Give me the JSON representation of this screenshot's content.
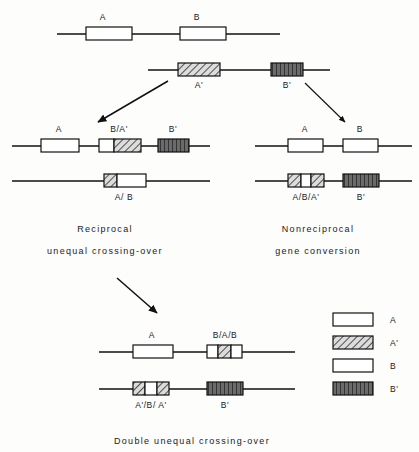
{
  "figure": {
    "header_note": "",
    "legend": {
      "name": "gene-legend",
      "entries": [
        {
          "label": "A",
          "fill": "white",
          "pattern": "empty"
        },
        {
          "label": "A'",
          "fill": "hatch",
          "pattern": "diagonal-hatch"
        },
        {
          "label": "B",
          "fill": "white",
          "pattern": "empty"
        },
        {
          "label": "B'",
          "fill": "dark",
          "pattern": "vertical-stripe-dark"
        }
      ]
    },
    "captions": {
      "left_line1": "Reciprocal",
      "left_line2": "unequal  crossing-over",
      "right_line1": "Nonreciprocal",
      "right_line2": "gene  conversion",
      "bottom": "Double  unequal  crossing-over"
    },
    "parental": [
      {
        "name": "parental-chromosome-top",
        "genes": [
          {
            "label": "A",
            "pattern": "empty"
          },
          {
            "label": "B",
            "pattern": "empty"
          }
        ]
      },
      {
        "name": "parental-chromosome-variant",
        "genes": [
          {
            "label": "A'",
            "pattern": "diagonal-hatch"
          },
          {
            "label": "B'",
            "pattern": "vertical-stripe-dark"
          }
        ]
      }
    ],
    "left_branch": {
      "name": "reciprocal-unequal-crossing-over",
      "chromosomes": [
        {
          "name": "recombinant-chromosome-1",
          "genes": [
            {
              "label": "A",
              "pattern": "empty"
            },
            {
              "label": "B/A'",
              "pattern": "empty+diagonal-hatch"
            },
            {
              "label": "B'",
              "pattern": "vertical-stripe-dark"
            }
          ]
        },
        {
          "name": "recombinant-chromosome-2",
          "genes": [
            {
              "label": "A/ B",
              "pattern": "diagonal-hatch+empty"
            }
          ]
        }
      ]
    },
    "right_branch": {
      "name": "nonreciprocal-gene-conversion",
      "chromosomes": [
        {
          "name": "converted-chromosome-1",
          "genes": [
            {
              "label": "A",
              "pattern": "empty"
            },
            {
              "label": "B",
              "pattern": "empty"
            }
          ]
        },
        {
          "name": "converted-chromosome-2",
          "genes": [
            {
              "label": "A/B/A'",
              "pattern": "hatch+empty+hatch"
            },
            {
              "label": "B'",
              "pattern": "vertical-stripe-dark"
            }
          ]
        }
      ]
    },
    "bottom_branch": {
      "name": "double-unequal-crossing-over",
      "chromosomes": [
        {
          "name": "double-recombinant-chromosome-1",
          "genes": [
            {
              "label": "A",
              "pattern": "empty"
            },
            {
              "label": "B/A/B",
              "pattern": "empty+hatch+empty"
            }
          ]
        },
        {
          "name": "double-recombinant-chromosome-2",
          "genes": [
            {
              "label": "A'/B/ A'",
              "pattern": "hatch+empty+hatch"
            },
            {
              "label": "B'",
              "pattern": "vertical-stripe-dark"
            }
          ]
        }
      ]
    },
    "colors": {
      "line": "#111111",
      "box_stroke": "#111111",
      "box_white": "#ffffff",
      "hatch_bg": "#d8d8d8",
      "dark_fill": "#555555"
    }
  }
}
